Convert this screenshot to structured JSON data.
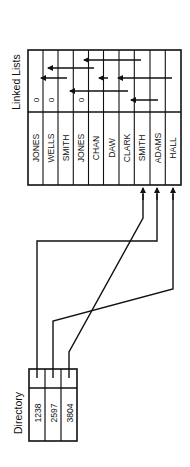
{
  "diagram": {
    "orientation": "rotated-90-ccw",
    "colors": {
      "ink": "#111111",
      "background": "#ffffff"
    },
    "linked_lists": {
      "title": "Linked Lists",
      "records": [
        {
          "name": "JONES",
          "pointer": "0"
        },
        {
          "name": "WELLS",
          "pointer": "0"
        },
        {
          "name": "SMITH",
          "pointer": ""
        },
        {
          "name": "JONES",
          "pointer": "0"
        },
        {
          "name": "CHAN",
          "pointer": ""
        },
        {
          "name": "DAW",
          "pointer": ""
        },
        {
          "name": "CLARK",
          "pointer": ""
        },
        {
          "name": "SMITH",
          "pointer": ""
        },
        {
          "name": "ADAMS",
          "pointer": ""
        },
        {
          "name": "HALL",
          "pointer": ""
        }
      ],
      "link_arrows": [
        {
          "row_y": 60,
          "from_x": 141,
          "to_x": 82
        },
        {
          "row_y": 68,
          "from_x": 94,
          "to_x": 46
        },
        {
          "row_y": 78,
          "from_x": 67,
          "to_x": 39
        },
        {
          "row_y": 78,
          "from_x": 108,
          "to_x": 97
        },
        {
          "row_y": 78,
          "from_x": 172,
          "to_x": 116
        },
        {
          "row_y": 91,
          "from_x": 128,
          "to_x": 68
        },
        {
          "row_y": 100,
          "from_x": 158,
          "to_x": 129
        }
      ]
    },
    "directory": {
      "title": "Directory",
      "entries": [
        {
          "key": "1238",
          "points_to": "SMITH"
        },
        {
          "key": "2597",
          "points_to": "HALL"
        },
        {
          "key": "3804",
          "points_to": "ADAMS"
        }
      ]
    }
  }
}
